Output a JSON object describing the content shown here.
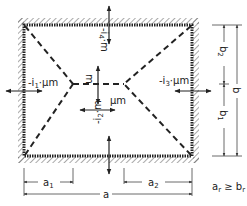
{
  "diagram": {
    "type": "yield-line-pattern-rectangular-slab",
    "colors": {
      "ink": "#222222",
      "hatch": "#555555",
      "dim": "#444444",
      "background": "#ffffff"
    },
    "moment_labels": {
      "left": {
        "prefix": "-i",
        "sub": "1",
        "suffix": "·μm"
      },
      "right": {
        "prefix": "-i",
        "sub": "3",
        "suffix": "·μm"
      },
      "top": {
        "prefix": "-i",
        "sub": "4",
        "suffix": "·m"
      },
      "bottom": {
        "prefix": "-i",
        "sub": "2",
        "suffix": "·m"
      },
      "center_vertical": "m",
      "center_horizontal": "μm"
    },
    "dimensions": {
      "a": "a",
      "a1": {
        "base": "a",
        "sub": "1"
      },
      "a2": {
        "base": "a",
        "sub": "2"
      },
      "b": "b",
      "b1": {
        "base": "b",
        "sub": "1"
      },
      "b2": {
        "base": "b",
        "sub": "2"
      }
    },
    "condition": {
      "left": "a",
      "left_sub": "r",
      "op": " ≥ ",
      "right": "b",
      "right_sub": "r"
    }
  }
}
